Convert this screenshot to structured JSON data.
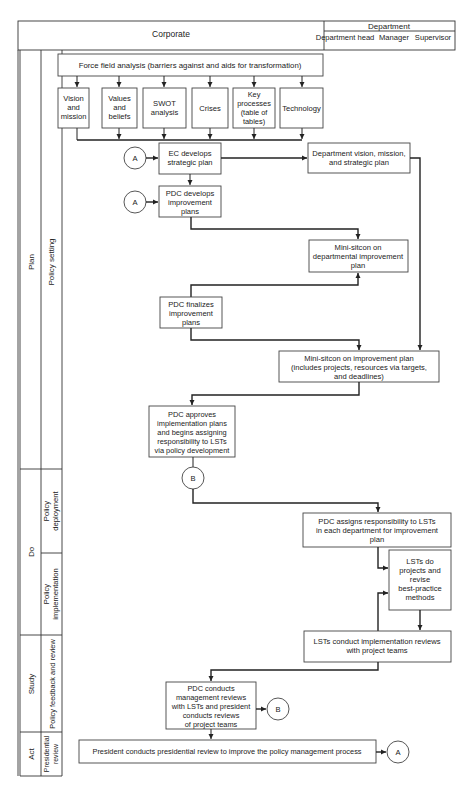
{
  "header": {
    "corporate": "Corporate",
    "department": "Department",
    "columns": [
      "Department head",
      "Manager",
      "Supervisor"
    ]
  },
  "phases": [
    {
      "label": "Plan",
      "stages": [
        {
          "label": "Policy setting"
        }
      ]
    },
    {
      "label": "Do",
      "stages": [
        {
          "label": "Policy deployment"
        },
        {
          "label": "Policy implementation"
        }
      ]
    },
    {
      "label": "Study",
      "stages": [
        {
          "label": "Policy feedback and review"
        }
      ]
    },
    {
      "label": "Act",
      "stages": [
        {
          "label": "Presidential review"
        }
      ]
    }
  ],
  "nodes": {
    "force_field": "Force field analysis (barriers against and aids for transformation)",
    "inputs": [
      [
        "Vision",
        "and",
        "mission"
      ],
      [
        "Values",
        "and",
        "beliefs"
      ],
      [
        "SWOT",
        "analysis"
      ],
      [
        "Crises"
      ],
      [
        "Key",
        "processes",
        "(table of",
        "tables)"
      ],
      [
        "Technology"
      ]
    ],
    "ec_develops": [
      "EC develops",
      "strategic plan"
    ],
    "dept_vision": [
      "Department vision, mission,",
      "and strategic plan"
    ],
    "pdc_develops": [
      "PDC develops",
      "improvement",
      "plans"
    ],
    "mini_sitcon_dept": [
      "Mini-sitcon on",
      "departmental improvement",
      "plan"
    ],
    "pdc_finalizes": [
      "PDC finalizes",
      "improvement",
      "plans"
    ],
    "mini_sitcon_improvement": [
      "Mini-sitcon on improvement plan",
      "(includes projects, resources via targets,",
      "and deadlines)"
    ],
    "pdc_approves": [
      "PDC approves",
      "implementation plans",
      "and begins assigning",
      "responsibility to LSTs",
      "via policy development"
    ],
    "pdc_assigns": [
      "PDC assigns responsibility to LSTs",
      "in each department for improvement",
      "plan"
    ],
    "lsts_do": [
      "LSTs do",
      "projects and",
      "revise",
      "best-practice",
      "methods"
    ],
    "lsts_conduct": [
      "LSTs conduct implementation reviews",
      "with project teams"
    ],
    "pdc_conducts": [
      "PDC conducts",
      "management reviews",
      "with LSTs and president",
      "conducts reviews",
      "of project teams"
    ],
    "president_review": "President conducts presidential review to improve the policy management process"
  },
  "connectors": {
    "a": "A",
    "b": "B"
  }
}
